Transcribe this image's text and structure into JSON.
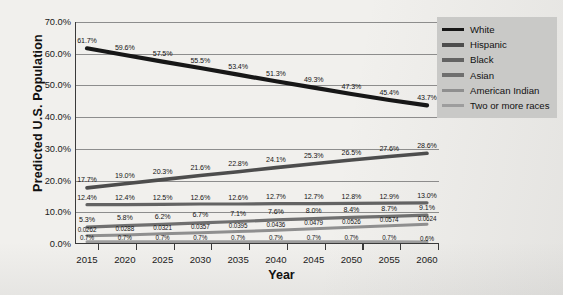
{
  "chart_data": {
    "type": "line",
    "title": "",
    "xlabel": "Year",
    "ylabel": "Predicted U.S. Population",
    "x": [
      2015,
      2020,
      2025,
      2030,
      2035,
      2040,
      2045,
      2050,
      2055,
      2060
    ],
    "xtick_labels": [
      "2015",
      "2020",
      "2025",
      "2030",
      "2035",
      "2040",
      "2045",
      "2050",
      "2055",
      "2060"
    ],
    "ylim": [
      0,
      70
    ],
    "ytick_labels": [
      "0.0%",
      "10.0%",
      "20.0%",
      "30.0%",
      "40.0%",
      "50.0%",
      "60.0%",
      "70.0%"
    ],
    "ytick_values": [
      0,
      10,
      20,
      30,
      40,
      50,
      60,
      70
    ],
    "grid": true,
    "legend_position": "top-right",
    "series": [
      {
        "name": "White",
        "color": "#171717",
        "width": 4.2,
        "values": [
          61.7,
          59.6,
          57.5,
          55.5,
          53.4,
          51.3,
          49.3,
          47.3,
          45.4,
          43.7
        ],
        "labels": [
          "61.7%",
          "59.6%",
          "57.5%",
          "55.5%",
          "53.4%",
          "51.3%",
          "49.3%",
          "47.3%",
          "45.4%",
          "43.7%"
        ]
      },
      {
        "name": "Hispanic",
        "color": "#4d4d4d",
        "width": 3.6,
        "values": [
          17.7,
          19.0,
          20.3,
          21.6,
          22.8,
          24.1,
          25.3,
          26.5,
          27.6,
          28.6
        ],
        "labels": [
          "17.7%",
          "19.0%",
          "20.3%",
          "21.6%",
          "22.8%",
          "24.1%",
          "25.3%",
          "26.5%",
          "27.6%",
          "28.6%"
        ]
      },
      {
        "name": "Black",
        "color": "#636363",
        "width": 3.2,
        "values": [
          12.4,
          12.4,
          12.5,
          12.6,
          12.6,
          12.7,
          12.7,
          12.8,
          12.9,
          13.0
        ],
        "labels": [
          "12.4%",
          "12.4%",
          "12.5%",
          "12.6%",
          "12.6%",
          "12.7%",
          "12.7%",
          "12.8%",
          "12.9%",
          "13.0%"
        ]
      },
      {
        "name": "Asian",
        "color": "#6f6f6f",
        "width": 3.2,
        "values": [
          5.3,
          5.8,
          6.2,
          6.7,
          7.1,
          7.6,
          8.0,
          8.4,
          8.7,
          9.1
        ],
        "labels": [
          "5.3%",
          "5.8%",
          "6.2%",
          "6.7%",
          "7.1%",
          "7.6%",
          "8.0%",
          "8.4%",
          "8.7%",
          "9.1%"
        ]
      },
      {
        "name": "American Indian",
        "color": "#8f8f8f",
        "width": 3.0,
        "values": [
          2.62,
          2.88,
          3.21,
          3.57,
          3.95,
          4.36,
          4.79,
          5.26,
          5.74,
          6.24
        ],
        "labels": [
          "0.0262",
          "0.0288",
          "0.0321",
          "0.0357",
          "0.0395",
          "0.0436",
          "0.0479",
          "0.0526",
          "0.0574",
          "0.0624"
        ]
      },
      {
        "name": "Two or more races",
        "color": "#9d9d9d",
        "width": 3.0,
        "values": [
          0.7,
          0.7,
          0.7,
          0.7,
          0.7,
          0.7,
          0.7,
          0.7,
          0.7,
          0.6
        ],
        "labels": [
          "0.7%",
          "0.7%",
          "0.7%",
          "0.7%",
          "0.7%",
          "0.7%",
          "0.7%",
          "0.7%",
          "0.7%",
          "0.6%"
        ]
      }
    ]
  },
  "legend": {
    "items": [
      {
        "label": "White",
        "color": "#171717"
      },
      {
        "label": "Hispanic",
        "color": "#4d4d4d"
      },
      {
        "label": "Black",
        "color": "#636363"
      },
      {
        "label": "Asian",
        "color": "#6f6f6f"
      },
      {
        "label": "American Indian",
        "color": "#8f8f8f"
      },
      {
        "label": "Two or more races",
        "color": "#9d9d9d"
      }
    ]
  }
}
